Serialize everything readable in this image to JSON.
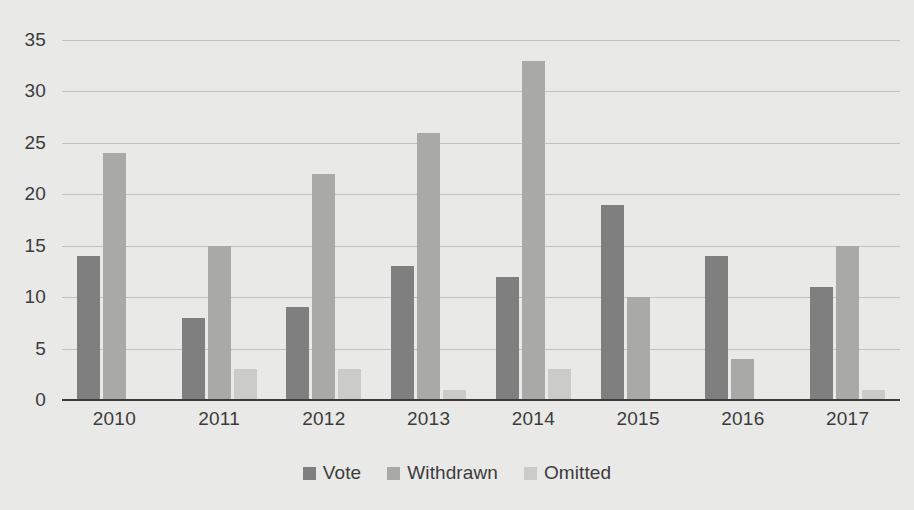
{
  "chart_data": {
    "type": "bar",
    "title": "",
    "subtitle": "",
    "xlabel": "",
    "ylabel": "",
    "categories": [
      "2010",
      "2011",
      "2012",
      "2013",
      "2014",
      "2015",
      "2016",
      "2017"
    ],
    "series": [
      {
        "name": "Vote",
        "color": "#7f7f7f",
        "values": [
          14,
          8,
          9,
          13,
          12,
          19,
          14,
          11
        ]
      },
      {
        "name": "Withdrawn",
        "color": "#a9a9a7",
        "values": [
          24,
          15,
          22,
          26,
          33,
          10,
          4,
          15
        ]
      },
      {
        "name": "Omitted",
        "color": "#cbcbc9",
        "values": [
          0,
          3,
          3,
          1,
          3,
          0,
          0,
          1
        ]
      }
    ],
    "ylim": [
      0,
      35
    ],
    "ytick_labels": [
      "0",
      "5",
      "10",
      "15",
      "20",
      "25",
      "30",
      "35"
    ],
    "ytick_values": [
      0,
      5,
      10,
      15,
      20,
      25,
      30,
      35
    ],
    "grid": true,
    "legend_position": "bottom",
    "background_color": "#e9e9e7",
    "gridline_color": "#c2c2c0",
    "axis_color": "#3a3a3a",
    "text_color": "#3c3c3c"
  }
}
